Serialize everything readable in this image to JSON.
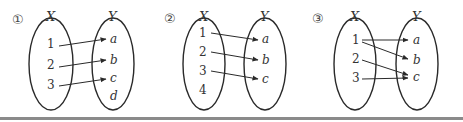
{
  "diagrams": [
    {
      "label": "①",
      "domain_label": "X",
      "codomain_label": "Y",
      "domain": [
        "1",
        "2",
        "3"
      ],
      "codomain": [
        "a",
        "b",
        "c",
        "d"
      ],
      "mappings": [
        [
          "1",
          "a"
        ],
        [
          "2",
          "b"
        ],
        [
          "3",
          "c"
        ]
      ]
    },
    {
      "label": "②",
      "domain_label": "X",
      "codomain_label": "Y",
      "domain": [
        "1",
        "2",
        "3",
        "4"
      ],
      "codomain": [
        "a",
        "b",
        "c"
      ],
      "mappings": [
        [
          "1",
          "a"
        ],
        [
          "2",
          "b"
        ],
        [
          "3",
          "c"
        ]
      ]
    },
    {
      "label": "③",
      "domain_label": "X",
      "codomain_label": "Y",
      "domain": [
        "1",
        "2",
        "3"
      ],
      "codomain": [
        "a",
        "b",
        "c"
      ],
      "mappings": [
        [
          "1",
          "a"
        ],
        [
          "1",
          "b"
        ],
        [
          "2",
          "c"
        ],
        [
          "3",
          "c"
        ]
      ]
    }
  ],
  "colors": {
    "stroke": "#2a2a2a",
    "text": "#333333",
    "bottom_bar": "#8a8a8a"
  }
}
